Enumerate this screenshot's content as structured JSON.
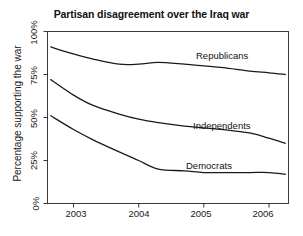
{
  "chart_data": {
    "type": "line",
    "title": "Partisan disagreement over the Iraq war",
    "xlabel": "",
    "ylabel": "Percentage supporting the war",
    "xlim": [
      2002.6,
      2006.3
    ],
    "ylim": [
      0,
      100
    ],
    "grid": false,
    "legend_position": "inline-right",
    "x_ticks": [
      "2003",
      "2004",
      "2005",
      "2006"
    ],
    "x_tick_values": [
      2003,
      2004,
      2005,
      2006
    ],
    "y_ticks": [
      "0%",
      "25%",
      "50%",
      "75%",
      "100%"
    ],
    "y_tick_values": [
      0,
      25,
      50,
      75,
      100
    ],
    "x": [
      2002.65,
      2003.0,
      2003.3,
      2003.7,
      2004.0,
      2004.3,
      2004.7,
      2005.0,
      2005.3,
      2005.7,
      2006.0,
      2006.25
    ],
    "series": [
      {
        "name": "Republicans",
        "label": "Republicans",
        "color": "#1a1a1a",
        "values": [
          91,
          87,
          84,
          81,
          81,
          82,
          81,
          80,
          79,
          77,
          76,
          75
        ]
      },
      {
        "name": "Independents",
        "label": "Independents",
        "color": "#1a1a1a",
        "values": [
          72,
          63,
          57,
          52,
          49,
          47,
          45,
          44,
          43,
          41,
          38,
          35
        ]
      },
      {
        "name": "Democrats",
        "label": "Democrats",
        "color": "#1a1a1a",
        "values": [
          51,
          43,
          37,
          30,
          25,
          20,
          19,
          18,
          18,
          18,
          18,
          17
        ]
      }
    ],
    "annotations": [
      {
        "text": "Republicans",
        "x": 2005.35,
        "y": 86
      },
      {
        "text": "Independents",
        "x": 2005.25,
        "y": 46
      },
      {
        "text": "Democrats",
        "x": 2005.0,
        "y": 26
      }
    ],
    "axis_color": "#3a3a3a",
    "background": "#ffffff"
  }
}
